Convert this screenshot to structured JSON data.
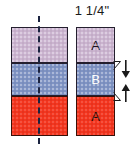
{
  "diagram": {
    "width_dimension": {
      "label": "1 1/4\"",
      "name": "width-dimension-label"
    },
    "left_block": {
      "name": "left-strip-block",
      "center_line": "dashed-center-fold-line",
      "strips": [
        {
          "label": "",
          "color": "#cbb4d0",
          "border": "#241f2e",
          "position": "top"
        },
        {
          "label": "",
          "color": "#7f93c4",
          "border": "#241f2e",
          "position": "middle"
        },
        {
          "label": "",
          "color": "#f4361f",
          "border": "#3a1008",
          "position": "bottom"
        }
      ]
    },
    "right_block": {
      "name": "right-strip-block",
      "strips": [
        {
          "label": "A",
          "color": "#cbb4d0",
          "text_color": "#1a1320",
          "border": "#241f2e",
          "position": "top"
        },
        {
          "label": "B",
          "color": "#7f93c4",
          "text_color": "#ffffff",
          "border": "#241f2e",
          "position": "middle"
        },
        {
          "label": "A",
          "color": "#f4361f",
          "text_color": "#2b0a04",
          "border": "#3a1008",
          "position": "bottom"
        }
      ]
    },
    "height_dimension": {
      "name": "height-dimension-arrows",
      "label": "",
      "top_arrow": "arrow-down-icon",
      "bottom_arrow": "arrow-up-icon"
    }
  },
  "colors": {
    "purple": "#cbb4d0",
    "blue": "#7f93c4",
    "red": "#f4361f",
    "outline": "#241f2e",
    "red_outline": "#3a1008",
    "dashed_line": "#1b2340",
    "text": "#1a1a1a",
    "background": "#ffffff"
  }
}
